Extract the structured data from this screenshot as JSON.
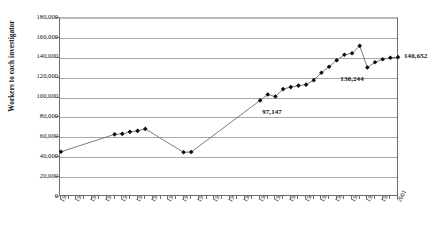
{
  "chart_data": {
    "type": "line",
    "title": "",
    "xlabel": "",
    "ylabel": "Workers to each investigator",
    "ylim": [
      0,
      180000
    ],
    "ytick_step": 20000,
    "ytick_labels": [
      "180,000",
      "160,000",
      "140,000",
      "120,000",
      "100,000",
      "80,000",
      "60,000",
      "40,000",
      "20,000",
      "0"
    ],
    "ytick_values": [
      180000,
      160000,
      140000,
      120000,
      100000,
      80000,
      60000,
      40000,
      20000,
      0
    ],
    "xtick_labels": [
      "1957",
      "1959",
      "1961",
      "1963",
      "1965",
      "1967",
      "1969",
      "1971",
      "1973",
      "1975",
      "1977",
      "1979",
      "1981",
      "1983",
      "1985",
      "1987",
      "1989",
      "1991",
      "1993",
      "1995",
      "1997",
      "1999",
      "2001"
    ],
    "xlim": [
      1957,
      2001
    ],
    "grid": "horizontal",
    "legend": "none",
    "marker": "diamond",
    "line_color": "#6e6e6e",
    "marker_color": "#0d0d0d",
    "x": [
      1957,
      1964,
      1965,
      1966,
      1967,
      1968,
      1973,
      1974,
      1983,
      1984,
      1985,
      1986,
      1987,
      1988,
      1989,
      1990,
      1991,
      1992,
      1993,
      1994,
      1995,
      1996,
      1997,
      1998,
      1999,
      2000,
      2001
    ],
    "values": [
      45500,
      63000,
      63500,
      65500,
      66500,
      68500,
      45000,
      45200,
      97147,
      103000,
      101000,
      108500,
      110500,
      112000,
      113000,
      117500,
      125000,
      131000,
      137500,
      143000,
      144500,
      152000,
      130244,
      135500,
      138500,
      140000,
      140652
    ],
    "annotations": [
      {
        "name": "label-97147",
        "text": "97,147",
        "value": 97147,
        "year": 1983
      },
      {
        "name": "label-130244",
        "text": "130,244",
        "value": 130244,
        "year": 1997
      },
      {
        "name": "label-140652",
        "text": "140,652",
        "value": 140652,
        "year": 2001
      }
    ]
  },
  "axis": {
    "y_title": "Workers to each investigator"
  }
}
